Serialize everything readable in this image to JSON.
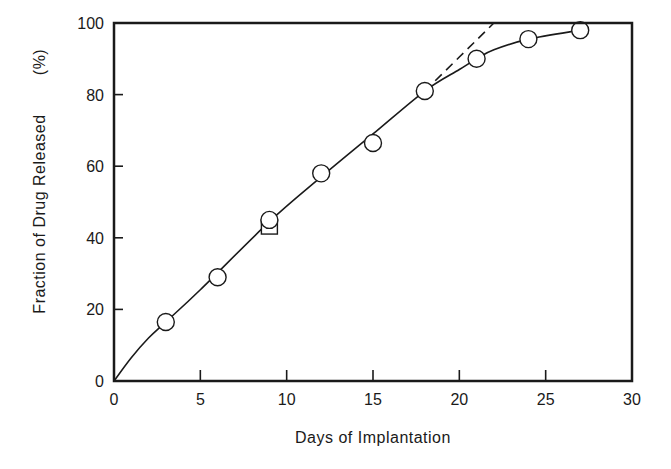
{
  "chart_data": {
    "type": "line",
    "title": "",
    "xlabel": "Days of Implantation",
    "ylabel": "Fraction of Drug Released (%)",
    "xlim": [
      0,
      30
    ],
    "ylim": [
      0,
      100
    ],
    "x_ticks": [
      0,
      5,
      10,
      15,
      20,
      25,
      30
    ],
    "y_ticks": [
      0,
      20,
      40,
      60,
      80,
      100
    ],
    "grid": false,
    "legend": null,
    "series": [
      {
        "name": "observed (circles)",
        "marker": "open-circle",
        "x": [
          3,
          6,
          9,
          12,
          15,
          18,
          21,
          24,
          27
        ],
        "y": [
          16.5,
          29,
          45,
          58,
          66.5,
          81,
          90,
          95.5,
          98
        ]
      },
      {
        "name": "observed (square)",
        "marker": "open-square",
        "x": [
          9
        ],
        "y": [
          43
        ]
      },
      {
        "name": "fitted curve",
        "style": "solid",
        "x": [
          0,
          1,
          2,
          3,
          5,
          9,
          12,
          15,
          18,
          20,
          21,
          22,
          24,
          27
        ],
        "y": [
          0,
          6.5,
          12,
          16.5,
          25.5,
          44.5,
          57,
          69,
          81,
          87,
          90,
          92.5,
          95.5,
          98
        ]
      },
      {
        "name": "linear extrapolation",
        "style": "dashed",
        "x": [
          18,
          22
        ],
        "y": [
          81,
          100
        ]
      }
    ]
  },
  "axes": {
    "x_title": "Days of Implantation",
    "y_title": "Fraction of Drug Released",
    "y_unit": "(%)",
    "x_tick_labels": [
      "0",
      "5",
      "10",
      "15",
      "20",
      "25",
      "30"
    ],
    "y_tick_labels": [
      "0",
      "20",
      "40",
      "60",
      "80",
      "100"
    ]
  },
  "colors": {
    "ink": "#1a1a1a",
    "background": "#ffffff"
  }
}
